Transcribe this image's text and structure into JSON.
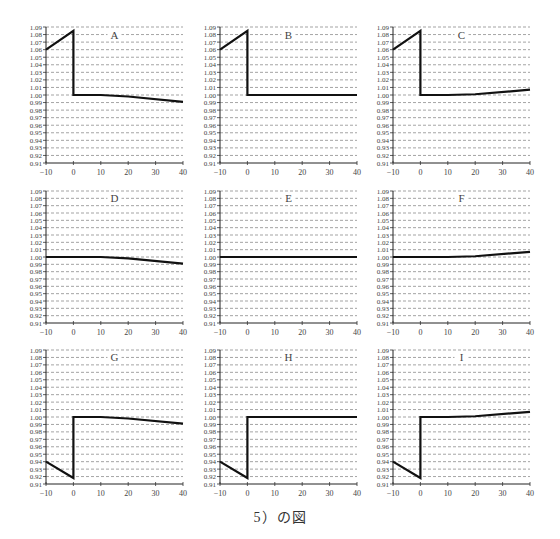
{
  "caption": "5）の図",
  "axes": {
    "x_ticks": [
      -10,
      0,
      10,
      20,
      30,
      40
    ],
    "x_tick_labels": [
      "−10",
      "0",
      "10",
      "20",
      "30",
      "40"
    ],
    "y_ticks": [
      0.91,
      0.92,
      0.93,
      0.94,
      0.95,
      0.96,
      0.97,
      0.98,
      0.99,
      1.0,
      1.01,
      1.02,
      1.03,
      1.04,
      1.05,
      1.06,
      1.07,
      1.08,
      1.09
    ],
    "y_tick_labels": [
      "0.91",
      "0.92",
      "0.93",
      "0.94",
      "0.95",
      "0.96",
      "0.97",
      "0.98",
      "0.99",
      "1.00",
      "1.01",
      "1.02",
      "1.03",
      "1.04",
      "1.05",
      "1.06",
      "1.07",
      "1.08",
      "1.09"
    ],
    "xlim": [
      -10,
      40
    ],
    "ylim": [
      0.91,
      1.09
    ],
    "grid": "horizontal dashed"
  },
  "chart_data": [
    {
      "type": "line",
      "title": "A",
      "xlabel": "",
      "ylabel": "",
      "xlim": [
        -10,
        40
      ],
      "ylim": [
        0.91,
        1.09
      ],
      "x": [
        -10,
        0,
        0,
        10,
        20,
        40
      ],
      "values": [
        1.06,
        1.085,
        1.0,
        1.0,
        0.998,
        0.991
      ]
    },
    {
      "type": "line",
      "title": "B",
      "xlabel": "",
      "ylabel": "",
      "xlim": [
        -10,
        40
      ],
      "ylim": [
        0.91,
        1.09
      ],
      "x": [
        -10,
        0,
        0,
        10,
        20,
        40
      ],
      "values": [
        1.06,
        1.085,
        1.0,
        1.0,
        1.0,
        1.0
      ]
    },
    {
      "type": "line",
      "title": "C",
      "xlabel": "",
      "ylabel": "",
      "xlim": [
        -10,
        40
      ],
      "ylim": [
        0.91,
        1.09
      ],
      "x": [
        -10,
        0,
        0,
        10,
        20,
        40
      ],
      "values": [
        1.06,
        1.085,
        1.0,
        1.0,
        1.001,
        1.007
      ]
    },
    {
      "type": "line",
      "title": "D",
      "xlabel": "",
      "ylabel": "",
      "xlim": [
        -10,
        40
      ],
      "ylim": [
        0.91,
        1.09
      ],
      "x": [
        -10,
        0,
        10,
        20,
        40
      ],
      "values": [
        1.0,
        1.0,
        1.0,
        0.998,
        0.991
      ]
    },
    {
      "type": "line",
      "title": "E",
      "xlabel": "",
      "ylabel": "",
      "xlim": [
        -10,
        40
      ],
      "ylim": [
        0.91,
        1.09
      ],
      "x": [
        -10,
        0,
        10,
        20,
        40
      ],
      "values": [
        1.0,
        1.0,
        1.0,
        1.0,
        1.0
      ]
    },
    {
      "type": "line",
      "title": "F",
      "xlabel": "",
      "ylabel": "",
      "xlim": [
        -10,
        40
      ],
      "ylim": [
        0.91,
        1.09
      ],
      "x": [
        -10,
        0,
        10,
        20,
        40
      ],
      "values": [
        1.0,
        1.0,
        1.0,
        1.001,
        1.007
      ]
    },
    {
      "type": "line",
      "title": "G",
      "xlabel": "",
      "ylabel": "",
      "xlim": [
        -10,
        40
      ],
      "ylim": [
        0.91,
        1.09
      ],
      "x": [
        -10,
        0,
        0,
        10,
        20,
        40
      ],
      "values": [
        0.94,
        0.918,
        1.0,
        1.0,
        0.998,
        0.991
      ]
    },
    {
      "type": "line",
      "title": "H",
      "xlabel": "",
      "ylabel": "",
      "xlim": [
        -10,
        40
      ],
      "ylim": [
        0.91,
        1.09
      ],
      "x": [
        -10,
        0,
        0,
        10,
        20,
        40
      ],
      "values": [
        0.94,
        0.918,
        1.0,
        1.0,
        1.0,
        1.0
      ]
    },
    {
      "type": "line",
      "title": "I",
      "xlabel": "",
      "ylabel": "",
      "xlim": [
        -10,
        40
      ],
      "ylim": [
        0.91,
        1.09
      ],
      "x": [
        -10,
        0,
        0,
        10,
        20,
        40
      ],
      "values": [
        0.94,
        0.918,
        1.0,
        1.0,
        1.001,
        1.007
      ]
    }
  ],
  "layout": {
    "panels": [
      {
        "left": 46,
        "top": 27,
        "width": 137,
        "height": 136
      },
      {
        "left": 220,
        "top": 27,
        "width": 137,
        "height": 136
      },
      {
        "left": 393,
        "top": 27,
        "width": 137,
        "height": 136
      },
      {
        "left": 46,
        "top": 191,
        "width": 137,
        "height": 132
      },
      {
        "left": 220,
        "top": 191,
        "width": 137,
        "height": 132
      },
      {
        "left": 393,
        "top": 191,
        "width": 137,
        "height": 132
      },
      {
        "left": 46,
        "top": 350,
        "width": 137,
        "height": 134
      },
      {
        "left": 220,
        "top": 350,
        "width": 137,
        "height": 134
      },
      {
        "left": 393,
        "top": 350,
        "width": 137,
        "height": 134
      }
    ],
    "line_color": "#111111",
    "grid_color": "#666666",
    "text_color": "#444444"
  }
}
